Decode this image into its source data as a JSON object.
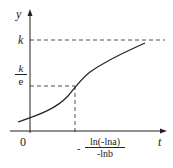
{
  "diagram": {
    "type": "function-curve",
    "x_axis_label": "t",
    "y_axis_label": "y",
    "origin_label": "0",
    "asymptote_label": "k",
    "inflection_y_label": {
      "num": "k",
      "den": "e"
    },
    "inflection_x_label": {
      "prefix": "-",
      "num": "ln(-lna)",
      "den": "-lnb"
    },
    "colors": {
      "line": "#222222",
      "background": "#ffffff"
    }
  }
}
